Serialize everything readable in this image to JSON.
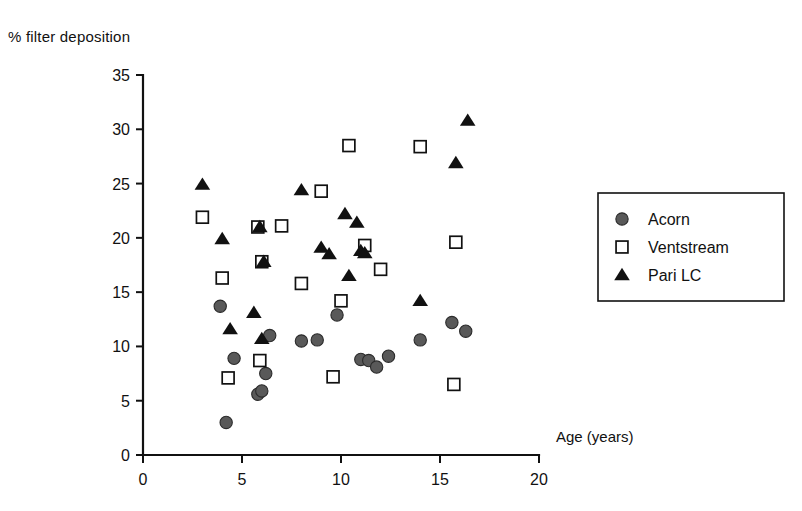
{
  "chart_data": {
    "type": "scatter",
    "title": "",
    "xlabel": "Age (years)",
    "ylabel": "% filter deposition",
    "xlim": [
      0,
      20
    ],
    "ylim": [
      0,
      35
    ],
    "xticks": [
      0,
      5,
      10,
      15,
      20
    ],
    "yticks": [
      0,
      5,
      10,
      15,
      20,
      25,
      30,
      35
    ],
    "grid": false,
    "legend_position": "right",
    "series": [
      {
        "name": "Acorn",
        "marker": "filled-circle",
        "color": "#595959",
        "points": [
          [
            3.9,
            13.7
          ],
          [
            4.2,
            3.0
          ],
          [
            4.6,
            8.9
          ],
          [
            5.8,
            5.6
          ],
          [
            6.0,
            5.9
          ],
          [
            6.2,
            7.5
          ],
          [
            6.4,
            11.0
          ],
          [
            8.0,
            10.5
          ],
          [
            8.8,
            10.6
          ],
          [
            9.8,
            12.9
          ],
          [
            11.0,
            8.8
          ],
          [
            11.4,
            8.7
          ],
          [
            11.8,
            8.1
          ],
          [
            12.4,
            9.1
          ],
          [
            14.0,
            10.6
          ],
          [
            15.6,
            12.2
          ],
          [
            16.3,
            11.4
          ]
        ]
      },
      {
        "name": "Ventstream",
        "marker": "open-square",
        "color": "#ffffff",
        "points": [
          [
            3.0,
            21.9
          ],
          [
            4.0,
            16.3
          ],
          [
            4.3,
            7.1
          ],
          [
            5.8,
            21.0
          ],
          [
            6.0,
            17.8
          ],
          [
            5.9,
            8.7
          ],
          [
            7.0,
            21.1
          ],
          [
            8.0,
            15.8
          ],
          [
            9.0,
            24.3
          ],
          [
            9.6,
            7.2
          ],
          [
            10.0,
            14.2
          ],
          [
            10.4,
            28.5
          ],
          [
            11.2,
            19.3
          ],
          [
            12.0,
            17.1
          ],
          [
            14.0,
            28.4
          ],
          [
            15.8,
            19.6
          ],
          [
            15.7,
            6.5
          ]
        ]
      },
      {
        "name": "Pari LC",
        "marker": "filled-triangle",
        "color": "#111111",
        "points": [
          [
            3.0,
            24.9
          ],
          [
            4.0,
            19.9
          ],
          [
            4.4,
            11.6
          ],
          [
            5.6,
            13.1
          ],
          [
            5.9,
            21.0
          ],
          [
            6.1,
            17.8
          ],
          [
            6.0,
            10.7
          ],
          [
            8.0,
            24.4
          ],
          [
            9.0,
            19.1
          ],
          [
            9.4,
            18.5
          ],
          [
            10.2,
            22.2
          ],
          [
            10.4,
            16.5
          ],
          [
            10.8,
            21.4
          ],
          [
            11.0,
            18.8
          ],
          [
            11.2,
            18.6
          ],
          [
            14.0,
            14.2
          ],
          [
            15.8,
            26.9
          ],
          [
            16.4,
            30.8
          ]
        ]
      }
    ]
  },
  "legend": {
    "entries": [
      {
        "label": "Acorn",
        "marker": "filled-circle"
      },
      {
        "label": "Ventstream",
        "marker": "open-square"
      },
      {
        "label": "Pari LC",
        "marker": "filled-triangle"
      }
    ]
  }
}
